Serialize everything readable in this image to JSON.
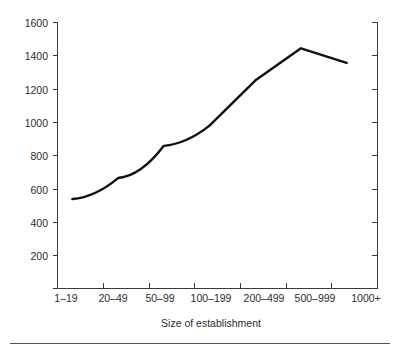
{
  "chart_data": {
    "type": "line",
    "title": "",
    "subtitle": "",
    "xlabel": "Size of establishment",
    "ylabel": "",
    "categories": [
      "1–19",
      "20–49",
      "50–99",
      "100–199",
      "200–499",
      "500–999",
      "1000+"
    ],
    "values": [
      555,
      685,
      885,
      1010,
      1290,
      1490,
      1400
    ],
    "series": [
      {
        "name": "",
        "values": [
          555,
          685,
          885,
          1010,
          1290,
          1490,
          1400
        ]
      }
    ],
    "ylim": [
      0,
      1650
    ],
    "yticks": [
      200,
      400,
      600,
      800,
      1000,
      1200,
      1400,
      1600
    ],
    "ytick_labels": [
      "200",
      "400",
      "600",
      "800",
      "1000",
      "1200",
      "1400",
      "1600"
    ],
    "grid": false,
    "legend": "none",
    "line_color": "#111111",
    "axis_color": "#3a3a3a",
    "background": "#ffffff"
  },
  "figure": {
    "xaxis_title": "Size of establishment",
    "bottom_rule_present": true
  }
}
